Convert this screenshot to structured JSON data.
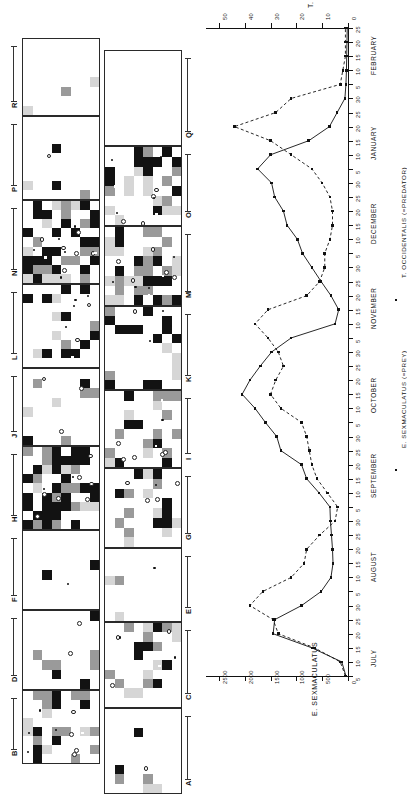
{
  "figure": {
    "caption_absent": true,
    "panel_ids_left": [
      "R",
      "P",
      "N",
      "L",
      "J",
      "H",
      "F",
      "D",
      "B"
    ],
    "panel_ids_right": [
      "Q",
      "O",
      "M",
      "K",
      "I",
      "G",
      "E",
      "C",
      "A"
    ]
  },
  "chart_data": {
    "type": "line",
    "title": "",
    "orientation": "rotated-90",
    "xlabel": "",
    "ylabel": "E. SEXMACULATUS",
    "y2label": "T. OCCIDENTALIS",
    "ylim": [
      0,
      2750
    ],
    "y2lim": [
      0,
      55
    ],
    "yticks": [
      0,
      500,
      1000,
      1500,
      2000,
      2500
    ],
    "yticklabels": [
      "0",
      "500",
      "1000",
      "1500",
      "2000",
      "2500"
    ],
    "y2ticks": [
      0,
      10,
      20,
      30,
      40,
      50
    ],
    "y2ticklabels": [
      "0",
      "10",
      "20",
      "30",
      "40",
      "50"
    ],
    "grid": false,
    "legend_position": "below-axis",
    "months": [
      "JULY",
      "AUGUST",
      "SEPTEMBER",
      "OCTOBER",
      "NOVEMBER",
      "DECEMBER",
      "JANUARY",
      "FEBRUARY"
    ],
    "day_ticks": [
      "5",
      "10",
      "15",
      "20",
      "25",
      "30"
    ],
    "legend": [
      {
        "name": "E. SEXMACULATUS (=PREY)",
        "style": "solid",
        "marker": "square"
      },
      {
        "name": "T. OCCIDENTALIS (=PREDATOR)",
        "style": "dashed",
        "marker": "square"
      }
    ],
    "series": [
      {
        "name": "E. SEXMACULATUS (=PREY)",
        "axis": "left",
        "style": "solid",
        "x": [
          "Jul 5",
          "Jul 10",
          "Jul 15",
          "Jul 20",
          "Jul 25",
          "Jul 30",
          "Aug 5",
          "Aug 10",
          "Aug 15",
          "Aug 20",
          "Aug 25",
          "Aug 30",
          "Sep 5",
          "Sep 10",
          "Sep 15",
          "Sep 20",
          "Sep 25",
          "Sep 30",
          "Oct 5",
          "Oct 10",
          "Oct 15",
          "Oct 20",
          "Oct 25",
          "Oct 30",
          "Nov 5",
          "Nov 10",
          "Nov 15",
          "Nov 20",
          "Nov 25",
          "Nov 30",
          "Dec 5",
          "Dec 10",
          "Dec 15",
          "Dec 20",
          "Dec 25",
          "Dec 30",
          "Jan 5",
          "Jan 10",
          "Jan 15",
          "Jan 20",
          "Jan 25",
          "Jan 30",
          "Feb 5",
          "Feb 10",
          "Feb 15",
          "Feb 20",
          "Feb 25"
        ],
        "values": [
          40,
          120,
          700,
          1450,
          1420,
          900,
          520,
          330,
          290,
          300,
          320,
          340,
          350,
          560,
          800,
          900,
          1300,
          1380,
          1600,
          1800,
          2050,
          1900,
          1700,
          1480,
          1100,
          250,
          180,
          330,
          520,
          700,
          880,
          980,
          1180,
          1250,
          1420,
          1480,
          1750,
          1500,
          760,
          360,
          210,
          60,
          40,
          30,
          25,
          20,
          15
        ]
      },
      {
        "name": "T. OCCIDENTALIS (=PREDATOR)",
        "axis": "right",
        "style": "dashed",
        "x": [
          "Jul 5",
          "Jul 10",
          "Jul 15",
          "Jul 20",
          "Jul 25",
          "Jul 30",
          "Aug 5",
          "Aug 10",
          "Aug 15",
          "Aug 20",
          "Aug 25",
          "Aug 30",
          "Sep 5",
          "Sep 10",
          "Sep 15",
          "Sep 20",
          "Sep 25",
          "Sep 30",
          "Oct 5",
          "Oct 10",
          "Oct 15",
          "Oct 20",
          "Oct 25",
          "Oct 30",
          "Nov 5",
          "Nov 10",
          "Nov 15",
          "Nov 20",
          "Nov 25",
          "Nov 30",
          "Dec 5",
          "Dec 10",
          "Dec 15",
          "Dec 20",
          "Dec 25",
          "Dec 30",
          "Jan 5",
          "Jan 10",
          "Jan 15",
          "Jan 20",
          "Jan 25",
          "Jan 30",
          "Feb 5",
          "Feb 10",
          "Feb 15",
          "Feb 20",
          "Feb 25"
        ],
        "values": [
          1,
          3,
          13,
          27,
          29,
          38,
          33,
          22,
          17,
          16,
          11,
          5,
          4,
          8,
          12,
          14,
          15,
          16,
          18,
          26,
          30,
          28,
          25,
          27,
          31,
          36,
          31,
          16,
          11,
          9,
          9,
          7,
          6,
          6,
          7,
          10,
          14,
          22,
          30,
          44,
          28,
          22,
          3,
          2,
          1,
          1,
          1
        ]
      }
    ]
  }
}
